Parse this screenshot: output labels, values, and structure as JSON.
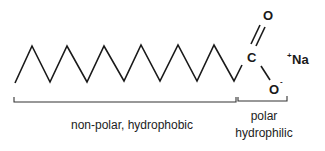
{
  "molecule": {
    "name": "sodium carboxylate soap molecule",
    "chain_points": [
      [
        15,
        83
      ],
      [
        32,
        46
      ],
      [
        50,
        82
      ],
      [
        67,
        46
      ],
      [
        87,
        82
      ],
      [
        104,
        46
      ],
      [
        124,
        81
      ],
      [
        141,
        45
      ],
      [
        160,
        81
      ],
      [
        178,
        45
      ],
      [
        197,
        81
      ],
      [
        214,
        45
      ],
      [
        234,
        81
      ],
      [
        242,
        65
      ]
    ],
    "atoms": {
      "carbon": "C",
      "carbonyl_oxygen": "O",
      "anion_oxygen": "O",
      "anion_charge": "-",
      "counter_ion": "Na",
      "counter_ion_charge": "+"
    }
  },
  "regions": {
    "nonpolar": {
      "label": "non-polar, hydrophobic"
    },
    "polar": {
      "line1": "polar",
      "line2": "hydrophilic"
    }
  },
  "colors": {
    "ink": "#1a1a1a",
    "background": "#ffffff"
  }
}
